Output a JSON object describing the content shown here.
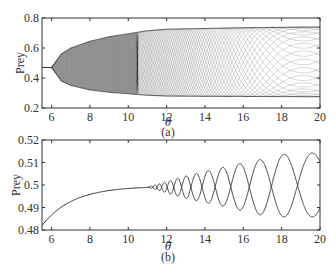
{
  "chart_data": [
    {
      "panel": "(a)",
      "type": "line",
      "title": "",
      "xlabel": "θ",
      "ylabel": "Prey",
      "xlim": [
        5.5,
        20
      ],
      "ylim": [
        0.2,
        0.8
      ],
      "xticks": [
        6,
        8,
        10,
        12,
        14,
        16,
        18,
        20
      ],
      "xtick_labels": [
        "6",
        "8",
        "10",
        "12",
        "14",
        "16",
        "18",
        "20"
      ],
      "yticks": [
        0.2,
        0.4,
        0.6,
        0.8
      ],
      "ytick_labels": [
        "0.2",
        "0.4",
        "0.6",
        "0.8"
      ],
      "grid": false,
      "description": "Bifurcation diagram: single equilibrium Prey≈0.47 for θ<6, Hopf bifurcation near θ≈6 into dense oscillation band; envelope upper bound rises to ≈0.72 by θ≈11 and ≈0.74 by θ=20, lower bound falls to ≈0.29 by θ≈11 and ≈0.28 by θ=20; braided crossing patterns beyond θ≈10.5.",
      "series": [
        {
          "name": "equilibrium",
          "x": [
            5.5,
            6.0
          ],
          "y": [
            0.47,
            0.47
          ]
        },
        {
          "name": "upper envelope",
          "x": [
            6.0,
            6.5,
            7,
            8,
            9,
            10,
            11,
            12,
            14,
            16,
            18,
            20
          ],
          "y": [
            0.47,
            0.56,
            0.6,
            0.645,
            0.675,
            0.695,
            0.715,
            0.725,
            0.73,
            0.735,
            0.738,
            0.74
          ]
        },
        {
          "name": "lower envelope",
          "x": [
            6.0,
            6.5,
            7,
            8,
            9,
            10,
            11,
            12,
            14,
            16,
            18,
            20
          ],
          "y": [
            0.47,
            0.38,
            0.35,
            0.32,
            0.305,
            0.295,
            0.285,
            0.28,
            0.278,
            0.277,
            0.276,
            0.275
          ]
        }
      ]
    },
    {
      "panel": "(b)",
      "type": "line",
      "title": "",
      "xlabel": "θ",
      "ylabel": "Prey",
      "xlim": [
        5.5,
        20
      ],
      "ylim": [
        0.48,
        0.52
      ],
      "xticks": [
        6,
        8,
        10,
        12,
        14,
        16,
        18,
        20
      ],
      "xtick_labels": [
        "6",
        "8",
        "10",
        "12",
        "14",
        "16",
        "18",
        "20"
      ],
      "yticks": [
        0.48,
        0.49,
        0.5,
        0.51,
        0.52
      ],
      "ytick_labels": [
        "0.48",
        "0.49",
        "0.5",
        "0.51",
        "0.52"
      ],
      "grid": false,
      "description": "Single curve rising from 0.482 at θ=5.5 to ≈0.499 at θ≈11, then splitting into crossing oscillation branches whose amplitude and wavelength grow with θ, reaching roughly 0.4855–0.5145 by θ≈19.",
      "series": [
        {
          "name": "main branch",
          "x": [
            5.5,
            6,
            7,
            8,
            9,
            10,
            11
          ],
          "y": [
            0.482,
            0.486,
            0.4925,
            0.4955,
            0.4972,
            0.4983,
            0.499
          ]
        },
        {
          "name": "oscillation upper envelope",
          "x": [
            11,
            12,
            13,
            14,
            15,
            16,
            17,
            18,
            19,
            20
          ],
          "y": [
            0.499,
            0.5015,
            0.504,
            0.506,
            0.508,
            0.5098,
            0.5115,
            0.5135,
            0.5145,
            0.514
          ]
        },
        {
          "name": "oscillation lower envelope",
          "x": [
            11,
            12,
            13,
            14,
            15,
            16,
            17,
            18,
            19,
            20
          ],
          "y": [
            0.499,
            0.4965,
            0.494,
            0.4922,
            0.4905,
            0.4885,
            0.4865,
            0.4858,
            0.4855,
            0.486
          ]
        }
      ]
    }
  ],
  "panels": {
    "a": {
      "label": "(a)",
      "xlabel": "θ",
      "ylabel": "Prey"
    },
    "b": {
      "label": "(b)",
      "xlabel": "θ",
      "ylabel": "Prey"
    }
  },
  "style": {
    "line_color": "#333333",
    "axis_color": "#333333",
    "background": "#ffffff"
  }
}
